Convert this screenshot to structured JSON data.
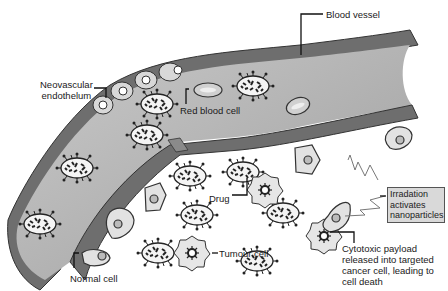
{
  "figure": {
    "labels": {
      "blood_vessel": "Blood vessel",
      "neovascular_line1": "Neovascular",
      "neovascular_line2": "endothelum",
      "red_blood_cell": "Red blood cell",
      "drug": "Drug",
      "tumour_cell": "Tumour cell",
      "normal_cell": "Normal cell",
      "irradiation_line1": "Irradation",
      "irradiation_line2": "activates",
      "irradiation_line3": "nanoparticles",
      "payload_line1": "Cytotoxic payload",
      "payload_line2": "released into targeted",
      "payload_line3": "cancer cell, leading to",
      "payload_line4": "cell death"
    },
    "colors": {
      "vessel_wall": "#6e6e6e",
      "vessel_lumen": "#b8b8b8",
      "cell_fill": "#e4e4e4",
      "outline": "#2a2a2a",
      "box_fill": "#d9d9d9"
    }
  }
}
